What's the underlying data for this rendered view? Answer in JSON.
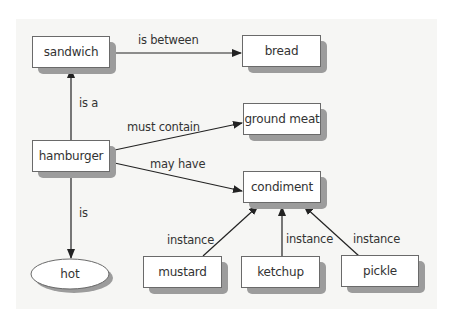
{
  "diagram": {
    "type": "semantic-network",
    "nodes": {
      "sandwich": {
        "label": "sandwich",
        "shape": "rect",
        "x": 32,
        "y": 36,
        "w": 78,
        "h": 32
      },
      "bread": {
        "label": "bread",
        "shape": "rect",
        "x": 242,
        "y": 35,
        "w": 79,
        "h": 32
      },
      "ground_meat": {
        "label": "ground meat",
        "shape": "rect",
        "x": 243,
        "y": 103,
        "w": 78,
        "h": 32
      },
      "hamburger": {
        "label": "hamburger",
        "shape": "rect",
        "x": 32,
        "y": 140,
        "w": 78,
        "h": 32
      },
      "condiment": {
        "label": "condiment",
        "shape": "rect",
        "x": 243,
        "y": 171,
        "w": 78,
        "h": 32
      },
      "hot": {
        "label": "hot",
        "shape": "ellipse",
        "cx": 70,
        "cy": 274,
        "rx": 39,
        "ry": 15
      },
      "mustard": {
        "label": "mustard",
        "shape": "rect",
        "x": 143,
        "y": 256,
        "w": 79,
        "h": 32
      },
      "ketchup": {
        "label": "ketchup",
        "shape": "rect",
        "x": 241,
        "y": 256,
        "w": 79,
        "h": 32
      },
      "pickle": {
        "label": "pickle",
        "shape": "rect",
        "x": 341,
        "y": 255,
        "w": 78,
        "h": 32
      }
    },
    "edges": [
      {
        "from": "sandwich",
        "to": "bread",
        "label": "is between"
      },
      {
        "from": "hamburger",
        "to": "sandwich",
        "label": "is a"
      },
      {
        "from": "hamburger",
        "to": "ground_meat",
        "label": "must contain"
      },
      {
        "from": "hamburger",
        "to": "condiment",
        "label": "may have"
      },
      {
        "from": "hamburger",
        "to": "hot",
        "label": "is"
      },
      {
        "from": "mustard",
        "to": "condiment",
        "label": "instance"
      },
      {
        "from": "ketchup",
        "to": "condiment",
        "label": "instance"
      },
      {
        "from": "pickle",
        "to": "condiment",
        "label": "instance"
      }
    ],
    "edge_labels": {
      "is_between": "is between",
      "is_a": "is a",
      "must_contain": "must contain",
      "may_have": "may have",
      "is": "is",
      "instance_mustard": "instance",
      "instance_ketchup": "instance",
      "instance_pickle": "instance"
    },
    "colors": {
      "panel_bg": "#f6f6f4",
      "node_fill": "#ffffff",
      "node_border": "#6a6a6a",
      "shadow": "#9c9c9c",
      "edge": "#222222",
      "text": "#333333"
    }
  }
}
